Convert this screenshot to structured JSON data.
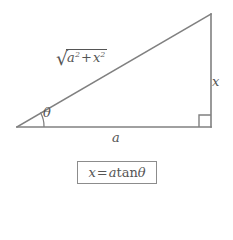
{
  "figure": {
    "type": "right-triangle-diagram",
    "background_color": "#ffffff",
    "line_color": "#808080",
    "text_color": "#555555",
    "vertices": {
      "left": [
        17,
        127
      ],
      "bottom_right": [
        211,
        127
      ],
      "top_right": [
        211,
        14
      ]
    },
    "labels": {
      "hypotenuse": {
        "text": "sqrt(a^2 + x^2)",
        "radical_sign": "√",
        "base_a": "a",
        "exp_a": "2",
        "operator": "+",
        "base_x": "x",
        "exp_x": "2"
      },
      "vertical_side": "x",
      "horizontal_side": "a",
      "angle": "θ"
    },
    "right_angle_marker": {
      "present": true,
      "corner": "bottom-right"
    },
    "angle_arc": {
      "present": true,
      "vertex": "left"
    }
  },
  "formula": {
    "text": "x = a tan θ",
    "lhs": "x",
    "equals": "=",
    "coefficient": "a",
    "function": "tan",
    "argument": "θ",
    "border_color": "#8c8c8c"
  }
}
